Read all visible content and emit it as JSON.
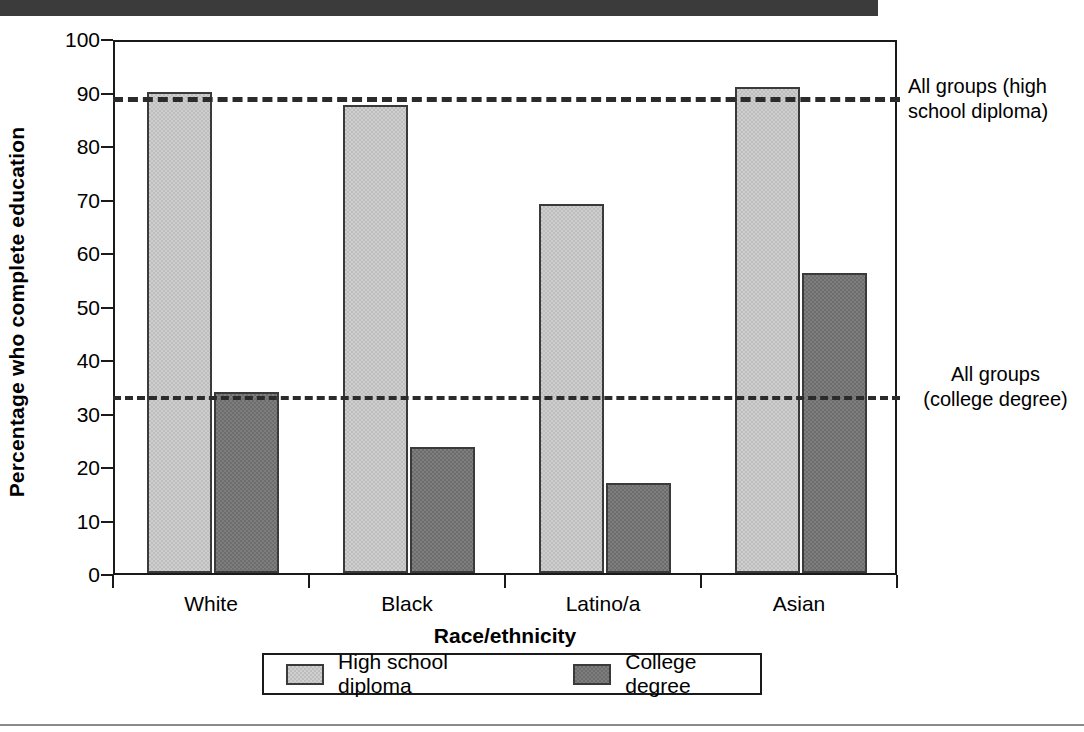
{
  "chart_data": {
    "type": "bar",
    "title": "",
    "xlabel": "Race/ethnicity",
    "ylabel": "Percentage who complete education",
    "categories": [
      "White",
      "Black",
      "Latino/a",
      "Asian"
    ],
    "series": [
      {
        "name": "High school diploma",
        "values": [
          89.9,
          87.4,
          69.0,
          90.8
        ],
        "color": "#cfcfcf"
      },
      {
        "name": "College degree",
        "values": [
          33.8,
          23.5,
          16.9,
          56.1
        ],
        "color": "#7e7e7e"
      }
    ],
    "ylim": [
      0,
      100
    ],
    "yticks": [
      "0",
      "10",
      "20",
      "30",
      "40",
      "50",
      "60",
      "70",
      "80",
      "90",
      "100"
    ],
    "grid": false,
    "legend_position": "bottom",
    "reference_lines": [
      {
        "name": "all-groups-high-school",
        "value": 89.4,
        "style": "dashed",
        "label_line1": "All groups (high",
        "label_line2": "school diploma)"
      },
      {
        "name": "all-groups-college",
        "value": 33.5,
        "style": "dotted",
        "label_line1": "All groups",
        "label_line2": "(college degree)"
      }
    ]
  },
  "legend": {
    "items": [
      {
        "label": "High school diploma"
      },
      {
        "label": "College degree"
      }
    ]
  },
  "annotations": {
    "hs_line_1": "All groups (high",
    "hs_line_2": "school diploma)",
    "col_line_1": "All groups",
    "col_line_2": "(college degree)"
  },
  "axes": {
    "y_title": "Percentage who complete education",
    "x_title": "Race/ethnicity",
    "y_ticks": [
      "100",
      "90",
      "80",
      "70",
      "60",
      "50",
      "40",
      "30",
      "20",
      "10",
      "0"
    ],
    "x_ticks": [
      "White",
      "Black",
      "Latino/a",
      "Asian"
    ]
  }
}
